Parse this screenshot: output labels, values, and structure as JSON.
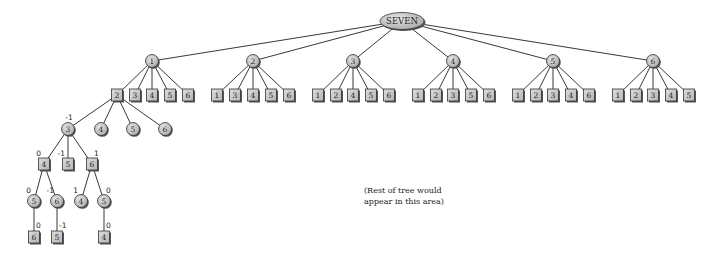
{
  "diagram": {
    "type": "game-tree",
    "root": {
      "id": "root",
      "label": "SEVEN",
      "x": 402,
      "y": 21
    },
    "colors": {
      "fill": "#c8c8c8",
      "stroke": "#333333",
      "shadow": "#555555",
      "edge": "#222222",
      "text": "#222222"
    },
    "nodes": [
      {
        "id": "n1",
        "label": "1",
        "shape": "circle",
        "x": 152,
        "y": 61,
        "parent": "root"
      },
      {
        "id": "n2",
        "label": "2",
        "shape": "circle",
        "x": 253,
        "y": 61,
        "parent": "root"
      },
      {
        "id": "n3",
        "label": "3",
        "shape": "circle",
        "x": 353,
        "y": 61,
        "parent": "root"
      },
      {
        "id": "n4",
        "label": "4",
        "shape": "circle",
        "x": 453,
        "y": 61,
        "parent": "root"
      },
      {
        "id": "n5",
        "label": "5",
        "shape": "circle",
        "x": 553,
        "y": 61,
        "parent": "root"
      },
      {
        "id": "n6",
        "label": "6",
        "shape": "circle",
        "x": 653,
        "y": 61,
        "parent": "root"
      },
      {
        "id": "n1a",
        "label": "2",
        "shape": "square",
        "x": 117,
        "y": 95,
        "parent": "n1"
      },
      {
        "id": "n1b",
        "label": "3",
        "shape": "square",
        "x": 135,
        "y": 95,
        "parent": "n1"
      },
      {
        "id": "n1c",
        "label": "4",
        "shape": "square",
        "x": 152,
        "y": 95,
        "parent": "n1"
      },
      {
        "id": "n1d",
        "label": "5",
        "shape": "square",
        "x": 170,
        "y": 95,
        "parent": "n1"
      },
      {
        "id": "n1e",
        "label": "6",
        "shape": "square",
        "x": 188,
        "y": 95,
        "parent": "n1"
      },
      {
        "id": "n2a",
        "label": "1",
        "shape": "square",
        "x": 217,
        "y": 95,
        "parent": "n2"
      },
      {
        "id": "n2b",
        "label": "3",
        "shape": "square",
        "x": 235,
        "y": 95,
        "parent": "n2"
      },
      {
        "id": "n2c",
        "label": "4",
        "shape": "square",
        "x": 253,
        "y": 95,
        "parent": "n2"
      },
      {
        "id": "n2d",
        "label": "5",
        "shape": "square",
        "x": 271,
        "y": 95,
        "parent": "n2"
      },
      {
        "id": "n2e",
        "label": "6",
        "shape": "square",
        "x": 289,
        "y": 95,
        "parent": "n2"
      },
      {
        "id": "n3a",
        "label": "1",
        "shape": "square",
        "x": 318,
        "y": 95,
        "parent": "n3"
      },
      {
        "id": "n3b",
        "label": "2",
        "shape": "square",
        "x": 336,
        "y": 95,
        "parent": "n3"
      },
      {
        "id": "n3c",
        "label": "4",
        "shape": "square",
        "x": 353,
        "y": 95,
        "parent": "n3"
      },
      {
        "id": "n3d",
        "label": "5",
        "shape": "square",
        "x": 371,
        "y": 95,
        "parent": "n3"
      },
      {
        "id": "n3e",
        "label": "6",
        "shape": "square",
        "x": 389,
        "y": 95,
        "parent": "n3"
      },
      {
        "id": "n4a",
        "label": "1",
        "shape": "square",
        "x": 418,
        "y": 95,
        "parent": "n4"
      },
      {
        "id": "n4b",
        "label": "2",
        "shape": "square",
        "x": 436,
        "y": 95,
        "parent": "n4"
      },
      {
        "id": "n4c",
        "label": "3",
        "shape": "square",
        "x": 453,
        "y": 95,
        "parent": "n4"
      },
      {
        "id": "n4d",
        "label": "5",
        "shape": "square",
        "x": 471,
        "y": 95,
        "parent": "n4"
      },
      {
        "id": "n4e",
        "label": "6",
        "shape": "square",
        "x": 489,
        "y": 95,
        "parent": "n4"
      },
      {
        "id": "n5a",
        "label": "1",
        "shape": "square",
        "x": 518,
        "y": 95,
        "parent": "n5"
      },
      {
        "id": "n5b",
        "label": "2",
        "shape": "square",
        "x": 536,
        "y": 95,
        "parent": "n5"
      },
      {
        "id": "n5c",
        "label": "3",
        "shape": "square",
        "x": 553,
        "y": 95,
        "parent": "n5"
      },
      {
        "id": "n5d",
        "label": "4",
        "shape": "square",
        "x": 571,
        "y": 95,
        "parent": "n5"
      },
      {
        "id": "n5e",
        "label": "6",
        "shape": "square",
        "x": 589,
        "y": 95,
        "parent": "n5"
      },
      {
        "id": "n6a",
        "label": "1",
        "shape": "square",
        "x": 618,
        "y": 95,
        "parent": "n6"
      },
      {
        "id": "n6b",
        "label": "2",
        "shape": "square",
        "x": 636,
        "y": 95,
        "parent": "n6"
      },
      {
        "id": "n6c",
        "label": "3",
        "shape": "square",
        "x": 653,
        "y": 95,
        "parent": "n6"
      },
      {
        "id": "n6d",
        "label": "4",
        "shape": "square",
        "x": 671,
        "y": 95,
        "parent": "n6"
      },
      {
        "id": "n6e",
        "label": "5",
        "shape": "square",
        "x": 689,
        "y": 95,
        "parent": "n6"
      },
      {
        "id": "m3",
        "label": "3",
        "shape": "circle",
        "x": 68,
        "y": 129,
        "parent": "n1a",
        "value": "-1"
      },
      {
        "id": "m4",
        "label": "4",
        "shape": "circle",
        "x": 101,
        "y": 129,
        "parent": "n1a"
      },
      {
        "id": "m5",
        "label": "5",
        "shape": "circle",
        "x": 133,
        "y": 129,
        "parent": "n1a"
      },
      {
        "id": "m6",
        "label": "6",
        "shape": "circle",
        "x": 165,
        "y": 129,
        "parent": "n1a"
      },
      {
        "id": "p4",
        "label": "4",
        "shape": "square",
        "x": 44,
        "y": 164,
        "parent": "m3",
        "value": "0"
      },
      {
        "id": "p5",
        "label": "5",
        "shape": "square",
        "x": 68,
        "y": 164,
        "parent": "m3",
        "value": "-1"
      },
      {
        "id": "p6",
        "label": "6",
        "shape": "square",
        "x": 92,
        "y": 164,
        "parent": "m3",
        "value": "1"
      },
      {
        "id": "q5",
        "label": "5",
        "shape": "circle",
        "x": 34,
        "y": 201,
        "parent": "p4",
        "value": "0"
      },
      {
        "id": "q6",
        "label": "6",
        "shape": "circle",
        "x": 57,
        "y": 201,
        "parent": "p4",
        "value": "-1"
      },
      {
        "id": "q4",
        "label": "4",
        "shape": "circle",
        "x": 81,
        "y": 201,
        "parent": "p6",
        "value": "1"
      },
      {
        "id": "q5b",
        "label": "5",
        "shape": "circle",
        "x": 104,
        "y": 201,
        "parent": "p6",
        "value": "0"
      },
      {
        "id": "r6",
        "label": "6",
        "shape": "square",
        "x": 34,
        "y": 237,
        "parent": "q5",
        "value": "0"
      },
      {
        "id": "r5",
        "label": "5",
        "shape": "square",
        "x": 57,
        "y": 237,
        "parent": "q6",
        "value": "-1"
      },
      {
        "id": "r4",
        "label": "4",
        "shape": "square",
        "x": 104,
        "y": 237,
        "parent": "q5b",
        "value": "0"
      }
    ],
    "note": {
      "line1": "(Rest of tree would",
      "line2": "appear in this area)"
    }
  }
}
